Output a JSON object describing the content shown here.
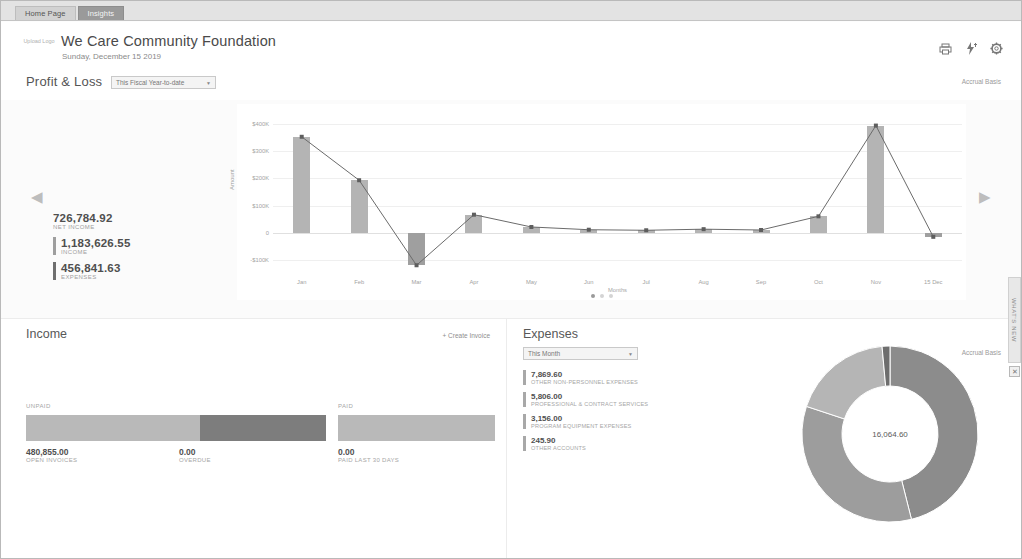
{
  "tabs": [
    {
      "label": "Home Page",
      "active": false
    },
    {
      "label": "Insights",
      "active": true
    }
  ],
  "header": {
    "logo_placeholder": "Upload Logo",
    "company": "We Care Community Foundation",
    "date": "Sunday, December 15 2019",
    "icons": [
      "print-icon",
      "bolt-icon",
      "gear-icon"
    ]
  },
  "profit_loss": {
    "title": "Profit & Loss",
    "period": "This Fiscal Year-to-date",
    "basis": "Accrual Basis",
    "kpis": [
      {
        "value": "726,784.92",
        "label": "NET INCOME"
      },
      {
        "value": "1,183,626.55",
        "label": "INCOME"
      },
      {
        "value": "456,841.63",
        "label": "EXPENSES"
      }
    ],
    "carousel_dots": 3,
    "carousel_active": 0,
    "prev_label": "◀",
    "next_label": "▶"
  },
  "income": {
    "title": "Income",
    "create_invoice": "+ Create Invoice",
    "unpaid_label": "UNPAID",
    "paid_label": "PAID",
    "stats": [
      {
        "value": "480,855.00",
        "label": "OPEN INVOICES"
      },
      {
        "value": "0.00",
        "label": "OVERDUE"
      },
      {
        "value": "0.00",
        "label": "PAID LAST 30 DAYS"
      }
    ],
    "unpaid_open_pct": 58,
    "unpaid_overdue_pct": 42,
    "paid_pct": 100
  },
  "expenses": {
    "title": "Expenses",
    "period": "This Month",
    "basis": "Accrual Basis",
    "total": "16,064.60",
    "items": [
      {
        "value": "7,869.60",
        "label": "OTHER NON-PERSONNEL EXPENSES"
      },
      {
        "value": "5,806.00",
        "label": "PROFESSIONAL & CONTRACT SERVICES"
      },
      {
        "value": "3,156.00",
        "label": "PROGRAM EQUIPMENT EXPENSES"
      },
      {
        "value": "245.90",
        "label": "OTHER ACCOUNTS"
      }
    ],
    "slices": [
      {
        "label": "OTHER NON-PERSONNEL EXPENSES",
        "value": 7869.6,
        "color": "#8c8c8c"
      },
      {
        "label": "PROFESSIONAL & CONTRACT SERVICES",
        "value": 5806.0,
        "color": "#9d9d9d"
      },
      {
        "label": "PROGRAM EQUIPMENT EXPENSES",
        "value": 3156.0,
        "color": "#b5b5b5"
      },
      {
        "label": "OTHER ACCOUNTS",
        "value": 245.9,
        "color": "#6e6e6e"
      }
    ]
  },
  "rail": {
    "label": "WHAT'S NEW",
    "close": "✕"
  },
  "chart_data": {
    "type": "bar",
    "title": "Profit & Loss",
    "xlabel": "Months",
    "ylabel": "Amount",
    "categories": [
      "Jan",
      "Feb",
      "Mar",
      "Apr",
      "May",
      "Jun",
      "Jul",
      "Aug",
      "Sep",
      "Oct",
      "Nov",
      "15 Dec"
    ],
    "values": [
      352000,
      193000,
      -118000,
      67000,
      22000,
      12000,
      10000,
      14000,
      11000,
      61000,
      393000,
      -14000
    ],
    "ylim": [
      -150000,
      450000
    ],
    "yticks": [
      400000,
      300000,
      200000,
      100000,
      0,
      -100000
    ],
    "yticklabels": [
      "$400K",
      "$300K",
      "$200K",
      "$100K",
      "0",
      "-$100K"
    ],
    "grid": true,
    "legend": false,
    "series": [
      {
        "name": "Net Income",
        "type": "bar",
        "values": [
          352000,
          193000,
          -118000,
          67000,
          22000,
          12000,
          10000,
          14000,
          11000,
          61000,
          393000,
          -14000
        ]
      },
      {
        "name": "Trend",
        "type": "line",
        "values": [
          352000,
          193000,
          -118000,
          67000,
          22000,
          12000,
          10000,
          14000,
          11000,
          61000,
          393000,
          -14000
        ]
      }
    ]
  }
}
